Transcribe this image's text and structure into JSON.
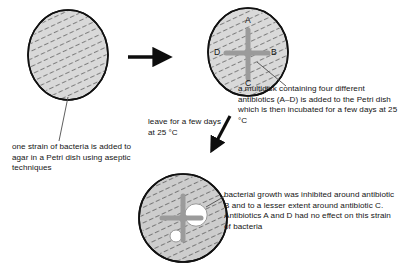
{
  "figure": {
    "background_color": "#ffffff",
    "agar_fill_color": "#d8d8d8",
    "agar_fill_color_grown": "#c9c9c9",
    "dish_outline_color": "#111111",
    "multidisk_color": "#9a9a9a",
    "clear_zone_color": "#ffffff",
    "text_color": "#141414"
  },
  "dishes": [
    {
      "id": "dish-initial",
      "name": "initial-petri-dish",
      "cx": 68,
      "cy": 55,
      "rx": 40,
      "ry": 45,
      "has_multidisk": false,
      "hatched": true
    },
    {
      "id": "dish-multidisk",
      "name": "multidisk-petri-dish",
      "cx": 248,
      "cy": 52,
      "rx": 40,
      "ry": 44,
      "has_multidisk": true,
      "hatched": true,
      "disk_labels": [
        {
          "label": "A",
          "position": "top",
          "x": 248,
          "y": 22
        },
        {
          "label": "B",
          "position": "right",
          "x": 272,
          "y": 53
        },
        {
          "label": "C",
          "position": "bottom",
          "x": 248,
          "y": 86
        },
        {
          "label": "D",
          "position": "left",
          "x": 223,
          "y": 53
        }
      ]
    },
    {
      "id": "dish-result",
      "name": "result-petri-dish",
      "cx": 183,
      "cy": 218,
      "rx": 44,
      "ry": 44,
      "has_multidisk": true,
      "hatched": true,
      "clear_zones": [
        {
          "around": "B",
          "cx": 196,
          "cy": 215,
          "r": 11,
          "size": "large"
        },
        {
          "around": "C",
          "cx": 176,
          "cy": 235,
          "r": 5.5,
          "size": "small"
        }
      ]
    }
  ],
  "arrows": [
    {
      "name": "arrow-right",
      "direction": "right",
      "from_x": 128,
      "from_y": 57,
      "to_x": 173,
      "to_y": 57
    },
    {
      "name": "arrow-down-left",
      "direction": "down-left",
      "from_x": 228,
      "from_y": 117,
      "to_x": 210,
      "to_y": 152
    }
  ],
  "leader_lines": [
    {
      "name": "leader-initial-dish",
      "from_x": 68,
      "from_y": 98,
      "to_x": 60,
      "to_y": 140
    },
    {
      "name": "leader-multidisk",
      "from_x": 258,
      "from_y": 62,
      "to_x": 285,
      "to_y": 86
    },
    {
      "name": "leader-result",
      "from_x": 205,
      "from_y": 208,
      "to_x": 224,
      "to_y": 196
    }
  ],
  "captions": {
    "bacteria": "one strain of bacteria is added to agar in a Petri dish using aseptic techniques",
    "multidisk": "a multidisk containing four different antibiotics (A–D) is added to the Petri dish which is then incubated for a few days at 25 °C",
    "leave": "leave for a few days at 25 °C",
    "result": "bacterial growth was inhibited around antibiotic B and to a lesser extent around antibiotic C. Antibiotics A and D had no effect on this strain of bacteria"
  },
  "disk_letters": {
    "a": "A",
    "b": "B",
    "c": "C",
    "d": "D"
  }
}
